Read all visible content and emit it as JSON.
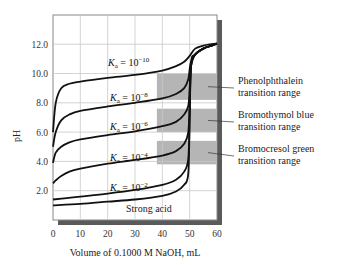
{
  "chart_data": {
    "type": "line",
    "title": "",
    "xlabel": "Volume of 0.1000 M NaOH, mL",
    "ylabel": "pH",
    "xlim": [
      0,
      60
    ],
    "ylim": [
      0,
      14
    ],
    "x_ticks": [
      "0",
      "10",
      "20",
      "30",
      "40",
      "50",
      "60"
    ],
    "y_ticks": [
      "2.0",
      "4.0",
      "6.0",
      "8.0",
      "10.0",
      "12.0"
    ],
    "grid": true,
    "series": [
      {
        "name": "Ka = 10^-10",
        "label_base": "K",
        "label_sub": "a",
        "label_eq": " = 10",
        "label_exp": "−10",
        "x": [
          0,
          1,
          3,
          6,
          10,
          20,
          30,
          40,
          45,
          48,
          50,
          52,
          55,
          58,
          60
        ],
        "y": [
          6.0,
          8.0,
          9.0,
          9.3,
          9.45,
          9.7,
          9.9,
          10.2,
          10.5,
          10.8,
          11.2,
          11.7,
          11.9,
          12.0,
          12.05
        ]
      },
      {
        "name": "Ka = 10^-8",
        "label_base": "K",
        "label_sub": "a",
        "label_eq": " = 10",
        "label_exp": "−8",
        "x": [
          0,
          1,
          3,
          6,
          10,
          20,
          30,
          40,
          45,
          48,
          49.5,
          50,
          50.5,
          52,
          55,
          58,
          60
        ],
        "y": [
          5.0,
          6.0,
          6.8,
          7.2,
          7.45,
          7.75,
          8.0,
          8.3,
          8.6,
          9.0,
          9.6,
          10.3,
          10.8,
          11.3,
          11.7,
          11.9,
          12.05
        ]
      },
      {
        "name": "Ka = 10^-6",
        "label_base": "K",
        "label_sub": "a",
        "label_eq": " = 10",
        "label_exp": "−6",
        "x": [
          0,
          1,
          3,
          6,
          10,
          20,
          30,
          40,
          45,
          48,
          49.5,
          50,
          50.5,
          52,
          55,
          58,
          60
        ],
        "y": [
          3.9,
          4.6,
          5.0,
          5.3,
          5.5,
          5.8,
          6.05,
          6.4,
          6.7,
          7.2,
          7.8,
          9.0,
          10.5,
          11.3,
          11.7,
          11.9,
          12.05
        ]
      },
      {
        "name": "Ka = 10^-4",
        "label_base": "K",
        "label_sub": "a",
        "label_eq": " = 10",
        "label_exp": "−4",
        "x": [
          0,
          1,
          3,
          6,
          10,
          20,
          30,
          40,
          45,
          48,
          49.5,
          50,
          50.5,
          52,
          55,
          58,
          60
        ],
        "y": [
          2.5,
          2.7,
          3.0,
          3.3,
          3.5,
          3.85,
          4.1,
          4.4,
          4.7,
          5.2,
          6.0,
          8.0,
          10.5,
          11.3,
          11.7,
          11.9,
          12.05
        ]
      },
      {
        "name": "Ka = 10^-2",
        "label_base": "K",
        "label_sub": "a",
        "label_eq": " = 10",
        "label_exp": "−2",
        "x": [
          0,
          5,
          10,
          20,
          30,
          40,
          45,
          48,
          49.5,
          50,
          50.5,
          52,
          55,
          58,
          60
        ],
        "y": [
          1.4,
          1.5,
          1.6,
          1.8,
          2.05,
          2.4,
          2.75,
          3.3,
          4.2,
          7.0,
          10.5,
          11.3,
          11.7,
          11.9,
          12.05
        ]
      },
      {
        "name": "Strong acid",
        "label_base": "Strong acid",
        "x": [
          0,
          10,
          20,
          30,
          40,
          45,
          48,
          49.5,
          50,
          50.5,
          52,
          55,
          58,
          60
        ],
        "y": [
          1.0,
          1.1,
          1.25,
          1.4,
          1.65,
          1.95,
          2.4,
          3.2,
          7.0,
          10.7,
          11.3,
          11.7,
          11.9,
          12.05
        ]
      }
    ],
    "bands": [
      {
        "name": "Phenolphthalein transition range",
        "line1": "Phenolphthalein",
        "line2": "transition range",
        "x_start": 38,
        "x_end": 60,
        "pH_low": 8.2,
        "pH_high": 10.0
      },
      {
        "name": "Bromothymol blue transition range",
        "line1": "Bromothymol blue",
        "line2": "transition range",
        "x_start": 38,
        "x_end": 60,
        "pH_low": 6.0,
        "pH_high": 7.6
      },
      {
        "name": "Bromocresol green transition range",
        "line1": "Bromocresol green",
        "line2": "transition range",
        "x_start": 38,
        "x_end": 60,
        "pH_low": 3.8,
        "pH_high": 5.4
      }
    ],
    "colors": {
      "curve": "#111111",
      "band": "#b5b5b5",
      "grid": "#c8c8c8",
      "frame": "#777777",
      "shadow": "#555555"
    }
  }
}
